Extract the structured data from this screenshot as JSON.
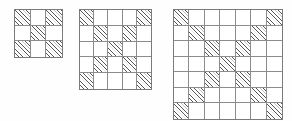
{
  "figure": {
    "name": "hatched-grid-sequence",
    "background_color": "#fefefe",
    "grid_line_color": "#8c8c8c",
    "border_color": "#7a7a7a",
    "hatch_color": "#555555",
    "hatch_angle_degrees": 45,
    "cell_fill_color": "#ffffff"
  },
  "chart_data": {
    "type": "heatmap",
    "title": "",
    "xlabel": "",
    "ylabel": "",
    "grid": true,
    "legend": "none",
    "grids": [
      {
        "label": "grid-3x3",
        "size": 3,
        "rows": 3,
        "columns": 3,
        "hatched_count": 5,
        "cells": [
          [
            1,
            0,
            1
          ],
          [
            0,
            1,
            0
          ],
          [
            1,
            0,
            1
          ]
        ]
      },
      {
        "label": "grid-5x5",
        "size": 5,
        "rows": 5,
        "columns": 5,
        "hatched_count": 9,
        "cells": [
          [
            1,
            0,
            0,
            0,
            1
          ],
          [
            0,
            1,
            0,
            1,
            0
          ],
          [
            0,
            0,
            1,
            0,
            0
          ],
          [
            0,
            1,
            0,
            1,
            0
          ],
          [
            1,
            0,
            0,
            0,
            1
          ]
        ]
      },
      {
        "label": "grid-7x7",
        "size": 7,
        "rows": 7,
        "columns": 7,
        "hatched_count": 13,
        "cells": [
          [
            1,
            0,
            0,
            0,
            0,
            0,
            1
          ],
          [
            0,
            1,
            0,
            0,
            0,
            1,
            0
          ],
          [
            0,
            0,
            1,
            0,
            1,
            0,
            0
          ],
          [
            0,
            0,
            0,
            1,
            0,
            0,
            0
          ],
          [
            0,
            0,
            1,
            0,
            1,
            0,
            0
          ],
          [
            0,
            1,
            0,
            0,
            0,
            1,
            0
          ],
          [
            1,
            0,
            0,
            0,
            0,
            0,
            1
          ]
        ]
      }
    ]
  }
}
